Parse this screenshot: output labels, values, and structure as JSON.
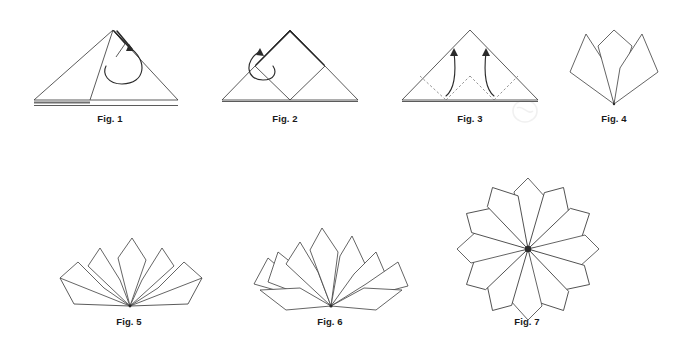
{
  "document": {
    "kind": "origami-folding-instructions",
    "background_color": "#ffffff",
    "line_color": "#3d3d3d",
    "caption_color": "#1a1a1a",
    "width": 678,
    "height": 340
  },
  "figures": [
    {
      "id": "fig-1",
      "caption": "Fig. 1",
      "caption_x": 110,
      "caption_y": 118,
      "description": "Folded triangle with corner flap being folded, curved arrow",
      "petal_count": 0
    },
    {
      "id": "fig-2",
      "caption": "Fig. 2",
      "caption_x": 285,
      "caption_y": 118,
      "description": "Triangle with inner diamond square fold, curved arrow at left",
      "petal_count": 0
    },
    {
      "id": "fig-3",
      "caption": "Fig. 3",
      "caption_x": 470,
      "caption_y": 118,
      "description": "Triangle with dashed valley fold lines and two upward curved arrows",
      "petal_count": 0
    },
    {
      "id": "fig-4",
      "caption": "Fig. 4",
      "caption_x": 614,
      "caption_y": 118,
      "description": "Three-petal fan radiating from bottom vertex",
      "petal_count": 3
    },
    {
      "id": "fig-5",
      "caption": "Fig. 5",
      "caption_x": 129,
      "caption_y": 322,
      "description": "Five-petal wider fan radiating from bottom vertex",
      "petal_count": 5
    },
    {
      "id": "fig-6",
      "caption": "Fig. 6",
      "caption_x": 330,
      "caption_y": 322,
      "description": "Half-circle fan with eight petals radiating from bottom vertex",
      "petal_count": 8
    },
    {
      "id": "fig-7",
      "caption": "Fig. 7",
      "caption_x": 527,
      "caption_y": 322,
      "description": "Completed full-circle star rosette with twelve petals",
      "petal_count": 12
    }
  ]
}
